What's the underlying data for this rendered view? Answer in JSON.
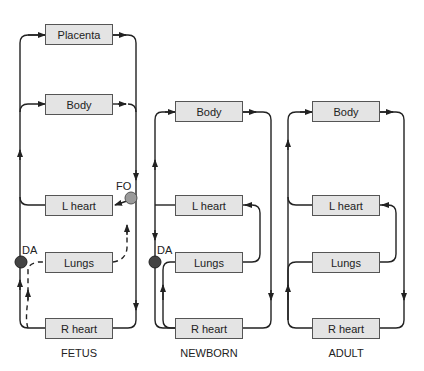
{
  "diagrams": {
    "fetus": {
      "caption": "FETUS",
      "boxes": {
        "placenta": "Placenta",
        "body": "Body",
        "lheart": "L heart",
        "lungs": "Lungs",
        "rheart": "R heart"
      },
      "labels": {
        "da": "DA",
        "fo": "FO"
      }
    },
    "newborn": {
      "caption": "NEWBORN",
      "boxes": {
        "body": "Body",
        "lheart": "L heart",
        "lungs": "Lungs",
        "rheart": "R heart"
      },
      "labels": {
        "da": "DA"
      }
    },
    "adult": {
      "caption": "ADULT",
      "boxes": {
        "body": "Body",
        "lheart": "L heart",
        "lungs": "Lungs",
        "rheart": "R heart"
      }
    }
  },
  "colors": {
    "box_fill": "#e4e4e4",
    "line": "#222222",
    "da_fill": "#444444",
    "fo_fill": "#9a9a9a"
  }
}
